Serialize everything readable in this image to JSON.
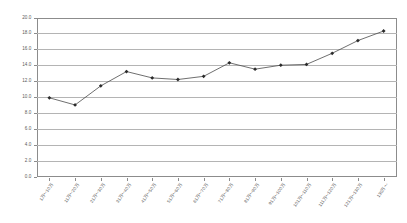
{
  "chart_data": {
    "type": "line",
    "title": "",
    "subtitle": "",
    "xlabel": "",
    "ylabel": "",
    "grid": true,
    "legend": false,
    "legend_position": "none",
    "ylim": [
      0.0,
      20.0
    ],
    "ytick_step": 2.0,
    "ytick_labels": [
      "20.0",
      "18.0",
      "16.0",
      "14.0",
      "12.0",
      "10.0",
      "8.0",
      "6.0",
      "4.0",
      "2.0",
      "0.0"
    ],
    "ytick_values": [
      20.0,
      18.0,
      16.0,
      14.0,
      12.0,
      10.0,
      8.0,
      6.0,
      4.0,
      2.0,
      0.0
    ],
    "categories": [
      "1万～10万",
      "11万～20万",
      "21万～30万",
      "31万～40万",
      "41万～50万",
      "51万～60万",
      "61万～70万",
      "71万～80万",
      "81万～90万",
      "91万～100万",
      "101万～110万",
      "111万～120万",
      "121万～130万",
      "130万～"
    ],
    "series": [
      {
        "name": "",
        "color": "#4a4a4a",
        "marker": "diamond",
        "values": [
          9.9,
          9.0,
          11.4,
          13.2,
          12.4,
          12.2,
          12.6,
          14.3,
          13.5,
          14.0,
          14.1,
          15.5,
          17.1,
          18.3
        ]
      }
    ]
  },
  "style": {
    "grid_color": "#b4b4b4",
    "axis_color": "#8c8c8c",
    "line_color": "#4a4a4a",
    "marker_color": "#2b2b2b",
    "text_color": "#5a5a5a",
    "background": "#ffffff"
  }
}
